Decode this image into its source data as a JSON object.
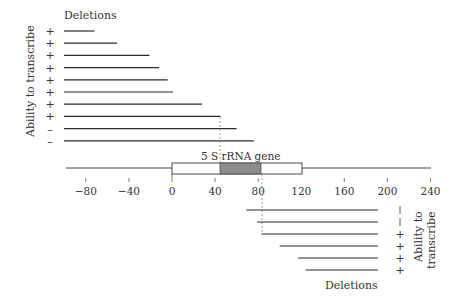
{
  "diagram": {
    "gene_label": "5 S rRNA gene",
    "axis": {
      "ticks": [
        -80,
        -40,
        0,
        40,
        80,
        120,
        160,
        200,
        240
      ],
      "tick_labels": [
        "−80",
        "−40",
        "0",
        "40",
        "80",
        "120",
        "160",
        "200",
        "240"
      ],
      "range": [
        -98,
        240
      ],
      "box_range": [
        0,
        120
      ],
      "gene_region": [
        45,
        83
      ]
    },
    "upstream_deletions": {
      "header": "Deletions",
      "side_label": "Ability to transcribe",
      "rows": [
        {
          "symbol": "+",
          "end": -72
        },
        {
          "symbol": "+",
          "end": -51
        },
        {
          "symbol": "+",
          "end": -21
        },
        {
          "symbol": "+",
          "end": -12
        },
        {
          "symbol": "+",
          "end": -4
        },
        {
          "symbol": "+",
          "end": 1
        },
        {
          "symbol": "+",
          "end": 28
        },
        {
          "symbol": "+",
          "end": 45
        },
        {
          "symbol": "—",
          "end": 60
        },
        {
          "symbol": "—",
          "end": 76
        }
      ]
    },
    "downstream_deletions": {
      "footer": "Deletions",
      "side_label_line1": "Ability to",
      "side_label_line2": "transcribe",
      "rows": [
        {
          "symbol": "|",
          "start": 69
        },
        {
          "symbol": "|",
          "start": 79
        },
        {
          "symbol": "+",
          "start": 83
        },
        {
          "symbol": "+",
          "start": 100
        },
        {
          "symbol": "+",
          "start": 117
        },
        {
          "symbol": "+",
          "start": 124
        }
      ],
      "end": 192
    },
    "colors": {
      "line": "#2b2b2b",
      "gene_fill": "#8c8c8c",
      "dashed": "#888888"
    }
  }
}
